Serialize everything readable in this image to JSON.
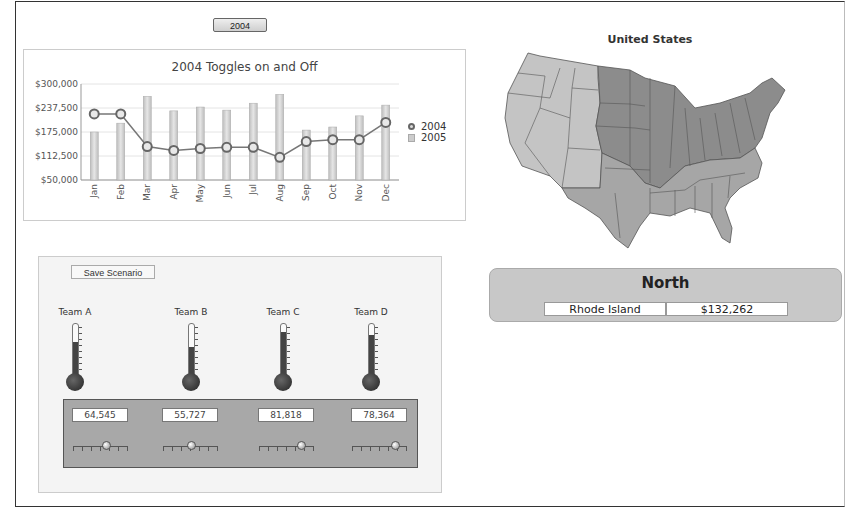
{
  "toolbar": {
    "year_button": "2004"
  },
  "chart_data": {
    "type": "bar",
    "title": "2004 Toggles on and Off",
    "xlabel": "",
    "ylabel": "",
    "ylim": [
      50000,
      300000
    ],
    "yticks": [
      "$300,000",
      "$237,500",
      "$175,000",
      "$112,500",
      "$50,000"
    ],
    "categories": [
      "Jan",
      "Feb",
      "Mar",
      "Apr",
      "May",
      "Jun",
      "Jul",
      "Aug",
      "Sep",
      "Oct",
      "Nov",
      "Dec"
    ],
    "series": [
      {
        "name": "2004",
        "type": "line",
        "values": [
          222000,
          222000,
          137000,
          127000,
          132000,
          135000,
          135000,
          109000,
          150000,
          155000,
          155000,
          200000
        ]
      },
      {
        "name": "2005",
        "type": "bar",
        "values": [
          175000,
          198000,
          268000,
          230000,
          240000,
          232000,
          250000,
          273000,
          180000,
          188000,
          217000,
          245000
        ]
      }
    ],
    "legend": [
      "2004",
      "2005"
    ],
    "legend_position": "right",
    "grid": true
  },
  "map": {
    "title": "United States",
    "regions": {
      "west": "#c4c4c4",
      "north": "#8c8c8c",
      "south": "#a6a6a6"
    }
  },
  "region_summary": {
    "name": "North",
    "state": "Rhode Island",
    "value": "$132,262"
  },
  "scenario": {
    "save_button": "Save Scenario",
    "teams": [
      {
        "label": "Team A",
        "value": "64,545",
        "fill_pct": 66,
        "slider_pct": 62
      },
      {
        "label": "Team B",
        "value": "55,727",
        "fill_pct": 57,
        "slider_pct": 52
      },
      {
        "label": "Team C",
        "value": "81,818",
        "fill_pct": 85,
        "slider_pct": 78
      },
      {
        "label": "Team D",
        "value": "78,364",
        "fill_pct": 80,
        "slider_pct": 80
      }
    ]
  }
}
